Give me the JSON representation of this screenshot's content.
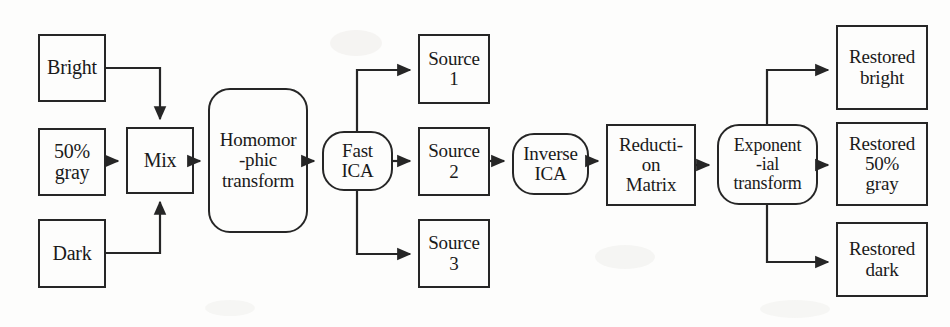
{
  "diagram": {
    "line_color": "#262626",
    "text_color": "#1a1a1a",
    "background_color": "#fdfdfc",
    "nodes": [
      {
        "id": "bright",
        "label": "Bright",
        "shape": "rect",
        "x": 38,
        "y": 34,
        "w": 68,
        "h": 68,
        "font": "f20"
      },
      {
        "id": "gray50",
        "label": "50%\ngray",
        "shape": "rect",
        "x": 38,
        "y": 128,
        "w": 68,
        "h": 68,
        "font": "f20"
      },
      {
        "id": "dark",
        "label": "Dark",
        "shape": "rect",
        "x": 38,
        "y": 219,
        "w": 68,
        "h": 69,
        "font": "f20"
      },
      {
        "id": "mix",
        "label": "Mix",
        "shape": "rect",
        "x": 126,
        "y": 127,
        "w": 68,
        "h": 67,
        "font": "f20"
      },
      {
        "id": "homomorphic",
        "label": "Homomor\n-phic\ntransform",
        "shape": "rounded",
        "x": 208,
        "y": 88,
        "w": 100,
        "h": 145,
        "font": "f19"
      },
      {
        "id": "fastica",
        "label": "Fast\nICA",
        "shape": "rounded",
        "x": 322,
        "y": 131,
        "w": 71,
        "h": 60,
        "font": "f19"
      },
      {
        "id": "source1",
        "label": "Source\n1",
        "shape": "rect",
        "x": 418,
        "y": 34,
        "w": 72,
        "h": 70,
        "font": "f19"
      },
      {
        "id": "source2",
        "label": "Source\n2",
        "shape": "rect",
        "x": 418,
        "y": 127,
        "w": 72,
        "h": 69,
        "font": "f19"
      },
      {
        "id": "source3",
        "label": "Source\n3",
        "shape": "rect",
        "x": 418,
        "y": 219,
        "w": 72,
        "h": 69,
        "font": "f19"
      },
      {
        "id": "inverseica",
        "label": "Inverse\nICA",
        "shape": "rounded",
        "x": 512,
        "y": 133,
        "w": 77,
        "h": 62,
        "font": "f19"
      },
      {
        "id": "reduction",
        "label": "Reducti-\non\nMatrix",
        "shape": "rect",
        "x": 606,
        "y": 124,
        "w": 90,
        "h": 82,
        "font": "f19"
      },
      {
        "id": "exponential",
        "label": "Exponent\n-ial\ntransform",
        "shape": "rounded",
        "x": 717,
        "y": 124,
        "w": 101,
        "h": 81,
        "font": "f18"
      },
      {
        "id": "restoredbright",
        "label": "Restored\nbright",
        "shape": "rect",
        "x": 836,
        "y": 25,
        "w": 92,
        "h": 85,
        "font": "f19"
      },
      {
        "id": "restoredgray",
        "label": "Restored\n50%\ngray",
        "shape": "rect",
        "x": 836,
        "y": 122,
        "w": 92,
        "h": 84,
        "font": "f19"
      },
      {
        "id": "restoreddark",
        "label": "Restored\ndark",
        "shape": "rect",
        "x": 836,
        "y": 222,
        "w": 92,
        "h": 75,
        "font": "f19"
      }
    ],
    "connections": [
      {
        "id": "bright-to-mix",
        "from": "bright",
        "to": "mix",
        "path": "M 106,68 L 160,68 L 160,119",
        "arrow": "down"
      },
      {
        "id": "gray-to-mix",
        "from": "gray50",
        "to": "mix",
        "path": "M 106,161 L 118,161",
        "arrow": "right"
      },
      {
        "id": "dark-to-mix",
        "from": "dark",
        "to": "mix",
        "path": "M 106,253 L 160,253 L 160,202",
        "arrow": "up"
      },
      {
        "id": "mix-to-homomorphic",
        "from": "mix",
        "to": "homomorphic",
        "path": "M 194,161 L 200,161",
        "arrow": "right"
      },
      {
        "id": "homomorphic-to-fastica",
        "from": "homomorphic",
        "to": "fastica",
        "path": "M 308,161 L 314,161",
        "arrow": "right"
      },
      {
        "id": "fastica-to-source1",
        "from": "fastica",
        "to": "source1",
        "path": "M 357,131 L 357,70 L 410,70",
        "arrow": "right"
      },
      {
        "id": "fastica-to-source2",
        "from": "fastica",
        "to": "source2",
        "path": "M 393,161 L 410,161",
        "arrow": "right"
      },
      {
        "id": "fastica-to-source3",
        "from": "fastica",
        "to": "source3",
        "path": "M 357,191 L 357,254 L 410,254",
        "arrow": "right"
      },
      {
        "id": "source2-to-inverseica",
        "from": "source2",
        "to": "inverseica",
        "path": "M 490,161 L 504,161",
        "arrow": "right"
      },
      {
        "id": "inverseica-to-reduction",
        "from": "inverseica",
        "to": "reduction",
        "path": "M 589,161 L 598,161",
        "arrow": "right"
      },
      {
        "id": "reduction-to-exponential",
        "from": "reduction",
        "to": "exponential",
        "path": "M 696,165 L 709,165",
        "arrow": "right"
      },
      {
        "id": "exponential-to-bright",
        "from": "exponential",
        "to": "restoredbright",
        "path": "M 767,124 L 767,70 L 828,70",
        "arrow": "right"
      },
      {
        "id": "exponential-to-gray",
        "from": "exponential",
        "to": "restoredgray",
        "path": "M 818,165 L 828,165",
        "arrow": "right"
      },
      {
        "id": "exponential-to-dark",
        "from": "exponential",
        "to": "restoreddark",
        "path": "M 767,205 L 767,262 L 828,262",
        "arrow": "right"
      }
    ]
  }
}
